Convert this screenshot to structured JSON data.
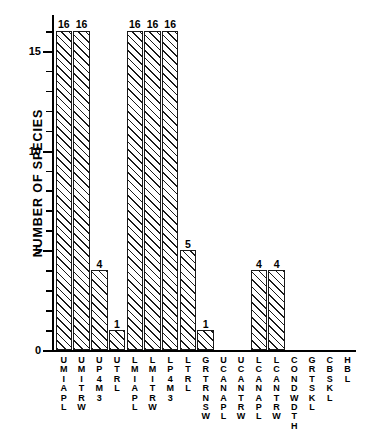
{
  "chart_data": {
    "type": "bar",
    "title": "",
    "subtitle": "",
    "xlabel": "",
    "ylabel": "NUMBER OF SPECIES",
    "ylim": [
      0,
      16.8
    ],
    "xlim": [
      0,
      16
    ],
    "grid": false,
    "legend": null,
    "y_major_ticks": [
      0,
      5,
      10,
      15
    ],
    "y_tick_labels": [
      "0",
      "5",
      "10",
      "15"
    ],
    "y_minor_ticks": [
      1,
      2,
      3,
      4,
      6,
      7,
      8,
      9,
      11,
      12,
      13,
      14,
      16
    ],
    "bar_fill": "diagonal-hatch",
    "bar_edge_color": "#1a1a1a",
    "bar_face_color": "#ffffff",
    "categories": [
      "UMIAPL",
      "UMITRW",
      "UP4M3",
      "UTRL",
      "LMIAPL",
      "LMITRW",
      "LP4M3",
      "LTRL",
      "GRTRNSW",
      "UCANAPL",
      "UCANTRW",
      "LCANAPL",
      "LCANTRW",
      "CONDWDTH",
      "GRTSKL",
      "CBSKL",
      "HBL"
    ],
    "category_letters": [
      [
        "U",
        "M",
        "I",
        "A",
        "P",
        "L"
      ],
      [
        "U",
        "M",
        "I",
        "T",
        "R",
        "W"
      ],
      [
        "U",
        "P",
        "4",
        "M",
        "3"
      ],
      [
        "U",
        "T",
        "R",
        "L"
      ],
      [
        "L",
        "M",
        "I",
        "A",
        "P",
        "L"
      ],
      [
        "L",
        "M",
        "I",
        "T",
        "R",
        "W"
      ],
      [
        "L",
        "P",
        "4",
        "M",
        "3"
      ],
      [
        "L",
        "T",
        "R",
        "L"
      ],
      [
        "G",
        "R",
        "T",
        "R",
        "N",
        "S",
        "W"
      ],
      [
        "U",
        "C",
        "A",
        "N",
        "A",
        "P",
        "L"
      ],
      [
        "U",
        "C",
        "A",
        "N",
        "T",
        "R",
        "W"
      ],
      [
        "L",
        "C",
        "A",
        "N",
        "A",
        "P",
        "L"
      ],
      [
        "L",
        "C",
        "A",
        "N",
        "T",
        "R",
        "W"
      ],
      [
        "C",
        "O",
        "N",
        "D",
        "W",
        "D",
        "T",
        "H"
      ],
      [
        "G",
        "R",
        "T",
        "S",
        "K",
        "L"
      ],
      [
        "C",
        "B",
        "S",
        "K",
        "L"
      ],
      [
        "H",
        "B",
        "L"
      ]
    ],
    "values": [
      16,
      16,
      4,
      1,
      16,
      16,
      16,
      5,
      1,
      0,
      0,
      4,
      4,
      0,
      0,
      0,
      0
    ],
    "value_labels": [
      "16",
      "16",
      "4",
      "1",
      "16",
      "16",
      "16",
      "5",
      "1",
      "",
      "",
      "4",
      "4",
      "",
      "",
      "",
      ""
    ]
  }
}
